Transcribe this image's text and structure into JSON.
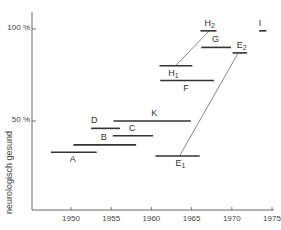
{
  "chart_data": {
    "type": "range-bar",
    "title": "",
    "xlabel": "",
    "ylabel": "neurologisch gesund",
    "x_ticks": [
      "1950",
      "1955",
      "1960",
      "1965",
      "1970",
      "1975"
    ],
    "y_ticks": [
      "50 %",
      "100 %"
    ],
    "xlim": [
      1945,
      1975
    ],
    "ylim": [
      0,
      100
    ],
    "grid": false,
    "legend": null,
    "series": [
      {
        "name": "A",
        "label": "A",
        "sub": "",
        "x_start": 1947.5,
        "x_end": 1953.2,
        "y": 33
      },
      {
        "name": "B",
        "label": "B",
        "sub": "",
        "x_start": 1950.3,
        "x_end": 1958.1,
        "y": 37
      },
      {
        "name": "C",
        "label": "C",
        "sub": "",
        "x_start": 1955.2,
        "x_end": 1960.2,
        "y": 42
      },
      {
        "name": "D",
        "label": "D",
        "sub": "",
        "x_start": 1952.5,
        "x_end": 1956.1,
        "y": 46
      },
      {
        "name": "K",
        "label": "K",
        "sub": "",
        "x_start": 1955.3,
        "x_end": 1964.9,
        "y": 50
      },
      {
        "name": "E1",
        "label": "E",
        "sub": "1",
        "x_start": 1960.5,
        "x_end": 1966.0,
        "y": 31
      },
      {
        "name": "E2",
        "label": "E",
        "sub": "2",
        "x_start": 1970.1,
        "x_end": 1971.9,
        "y": 87
      },
      {
        "name": "F",
        "label": "F",
        "sub": "",
        "x_start": 1961.1,
        "x_end": 1967.8,
        "y": 72
      },
      {
        "name": "H1",
        "label": "H",
        "sub": "1",
        "x_start": 1961.0,
        "x_end": 1965.1,
        "y": 80
      },
      {
        "name": "H2",
        "label": "H",
        "sub": "2",
        "x_start": 1966.1,
        "x_end": 1968.1,
        "y": 99
      },
      {
        "name": "G",
        "label": "G",
        "sub": "",
        "x_start": 1966.2,
        "x_end": 1969.9,
        "y": 90
      },
      {
        "name": "I",
        "label": "I",
        "sub": "",
        "x_start": 1973.4,
        "x_end": 1974.3,
        "y": 99
      }
    ],
    "connectors": [
      {
        "from": "E1",
        "to": "E2",
        "from_x": 1963.5,
        "to_x": 1970.8
      },
      {
        "from": "H1",
        "to": "H2",
        "from_x": 1963.0,
        "to_x": 1967.2
      }
    ]
  }
}
